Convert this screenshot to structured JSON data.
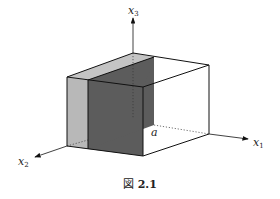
{
  "figure": {
    "caption_prefix": "図",
    "caption_number": "2.1",
    "axes": {
      "x1": {
        "base": "x",
        "sub": "1"
      },
      "x2": {
        "base": "x",
        "sub": "2"
      },
      "x3": {
        "base": "x",
        "sub": "3"
      }
    },
    "point_label": "a",
    "colors": {
      "line": "#111111",
      "light_shade": "#b8b8b8",
      "dark_shade": "#5a5a5a",
      "top_light": "#c4c4c4",
      "top_dark": "#7a7a7a"
    }
  }
}
